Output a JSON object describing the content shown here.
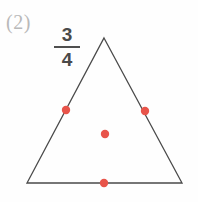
{
  "figure": {
    "problem_number": "(2)",
    "fraction": {
      "numerator": "3",
      "denominator": "4"
    },
    "shape": {
      "name": "triangle",
      "type": "isosceles",
      "stroke_color": "#4a4a4a",
      "stroke_width": 1.3,
      "fill": "none",
      "vertices": [
        {
          "name": "apex",
          "x": 104,
          "y": 38
        },
        {
          "name": "bottom-right",
          "x": 182,
          "y": 183
        },
        {
          "name": "bottom-left",
          "x": 27,
          "y": 183
        }
      ]
    },
    "markers": {
      "color": "#e8544a",
      "radius": 4.2,
      "count": 4,
      "points": [
        {
          "name": "left-edge-point",
          "x": 66,
          "y": 110
        },
        {
          "name": "right-edge-point",
          "x": 145,
          "y": 111
        },
        {
          "name": "interior-point",
          "x": 105,
          "y": 134
        },
        {
          "name": "bottom-edge-point",
          "x": 104,
          "y": 183
        }
      ]
    },
    "background_color": "#fefefe"
  }
}
